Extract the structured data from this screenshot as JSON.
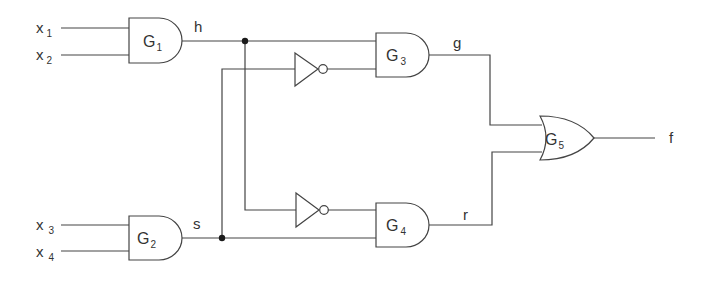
{
  "diagram": {
    "type": "logic-circuit",
    "colors": {
      "line": "#444444",
      "text": "#333333",
      "junction": "#1a1a1a",
      "background": "#ffffff"
    },
    "inputs": [
      {
        "id": "x1",
        "letter": "x",
        "sub": "1"
      },
      {
        "id": "x2",
        "letter": "x",
        "sub": "2"
      },
      {
        "id": "x3",
        "letter": "x",
        "sub": "3"
      },
      {
        "id": "x4",
        "letter": "x",
        "sub": "4"
      }
    ],
    "gates": [
      {
        "id": "G1",
        "letter": "G",
        "sub": "1",
        "kind": "AND",
        "inputs": [
          "x1",
          "x2"
        ],
        "output": "h"
      },
      {
        "id": "G2",
        "letter": "G",
        "sub": "2",
        "kind": "AND",
        "inputs": [
          "x3",
          "x4"
        ],
        "output": "s"
      },
      {
        "id": "G3",
        "letter": "G",
        "sub": "3",
        "kind": "AND",
        "inputs": [
          "h",
          "NOT s"
        ],
        "output": "g"
      },
      {
        "id": "G4",
        "letter": "G",
        "sub": "4",
        "kind": "AND",
        "inputs": [
          "NOT h",
          "s"
        ],
        "output": "r"
      },
      {
        "id": "G5",
        "letter": "G",
        "sub": "5",
        "kind": "OR",
        "inputs": [
          "g",
          "r"
        ],
        "output": "f"
      }
    ],
    "inverters": [
      {
        "id": "N1",
        "input": "s",
        "feeds": "G3"
      },
      {
        "id": "N2",
        "input": "h",
        "feeds": "G4"
      }
    ],
    "signals": {
      "h": "h",
      "s": "s",
      "g": "g",
      "r": "r",
      "f": "f"
    }
  }
}
